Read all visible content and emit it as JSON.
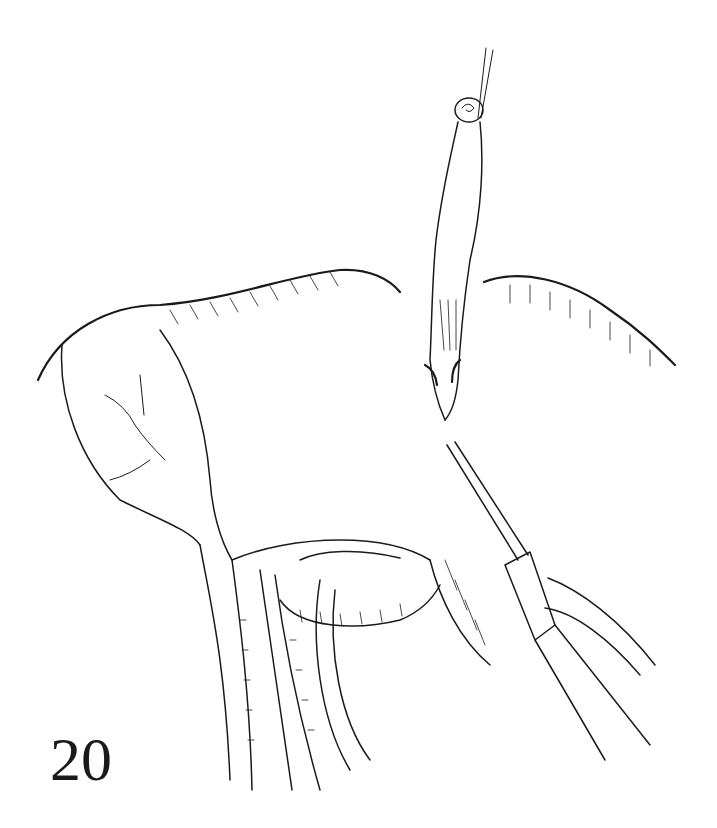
{
  "figure": {
    "number": "20",
    "colors": {
      "ink": "#1a1a1a",
      "background": "#ffffff"
    }
  },
  "labels": {
    "suture": "suture-thread",
    "appendix": "appendix",
    "cecum": "cecum",
    "instrument": "surgical-instrument",
    "vessels": "mesenteric-vessels"
  }
}
